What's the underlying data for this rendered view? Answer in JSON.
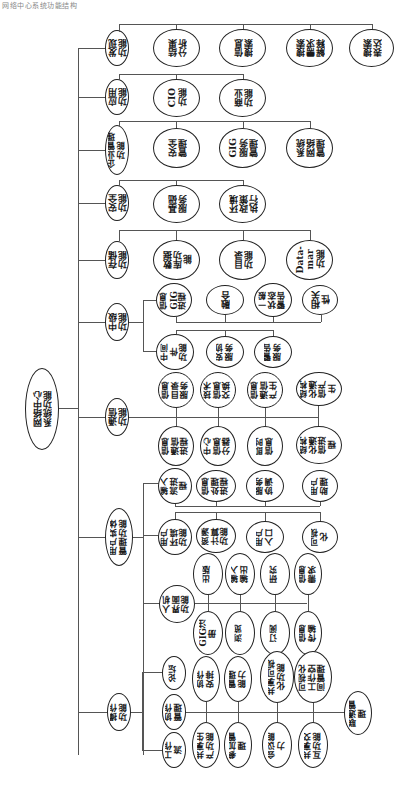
{
  "caption": "网络中心系统功能结构",
  "root": {
    "label": "网络中心\n系统功能"
  },
  "branches": [
    {
      "label": "发现\n功能",
      "children": [
        "结果\n分析",
        "信息\n搜索",
        "搜索\n需求\n解释",
        "搜索\n表达"
      ]
    },
    {
      "label": "应用\n功能",
      "children": [
        "CIO\n功能",
        "商业\n功能"
      ]
    },
    {
      "label": "企业管理\n功能",
      "children": [
        "安全\n管理",
        "GIG\n服务\n管理",
        "系统\n网络\n管理"
      ]
    },
    {
      "label": "安全\n功能",
      "children": [
        "基础\n服务",
        "环境\n政策\n执行"
      ]
    },
    {
      "label": "存储\n功能",
      "children": [
        "数据\n库功\n能",
        "目录\n功能",
        "Data-\nmar\n功能"
      ]
    },
    {
      "label": "中级\n功能",
      "upper_children": [
        "信息\nGIG\n进程",
        "融合",
        "一般\n状态\n警告",
        "相关\n性"
      ],
      "lower_children": [
        "中间\n件\n功能",
        "安协\n服务",
        "警告\n服务"
      ]
    },
    {
      "label": "通信\n功能",
      "upper_children": [
        "信息\n目录\n服务",
        "技术\n信息\n交换",
        "信息\n通信\n产生",
        "结构\n化通\n信产\n生"
      ],
      "lower_children": [
        "信息\n通信\n进程",
        "中心\n信息\n分器",
        "即时\n信息",
        "结构\n化通\n信进\n程"
      ]
    },
    {
      "label": "用户实体\n管理功能",
      "group1": [
        "输入\n流进\n程",
        "信息\n处理\n进程",
        "服务\n协调",
        "用户\n助理"
      ],
      "group2": [
        "用户\n环境\n功能",
        "资源\n计算\n功能",
        "用户\n入口",
        "可视\n化"
      ]
    },
    {
      "label": "人机\n界面\n功能",
      "upper_children": [
        "出版",
        "输入\n输出",
        "研究",
        "信息\n需求"
      ],
      "lower_children": [
        "GIG注\n册",
        "浏览",
        "订阅",
        "信息\n传输"
      ]
    },
    {
      "label": "操作\n功能",
      "sub": [
        "论坛",
        "协作\n管理",
        "工作\n流"
      ],
      "upper_children": [
        "协作\n安排",
        "管理\n能力",
        "共享可视\n化功能",
        "可视化\n工作空\n间管理"
      ],
      "lower_children": [
        "共享生\n产功能",
        "参加管\n理",
        "会议能\n力",
        "共享交\n互功能"
      ],
      "end_child": "联通管\n理"
    }
  ]
}
